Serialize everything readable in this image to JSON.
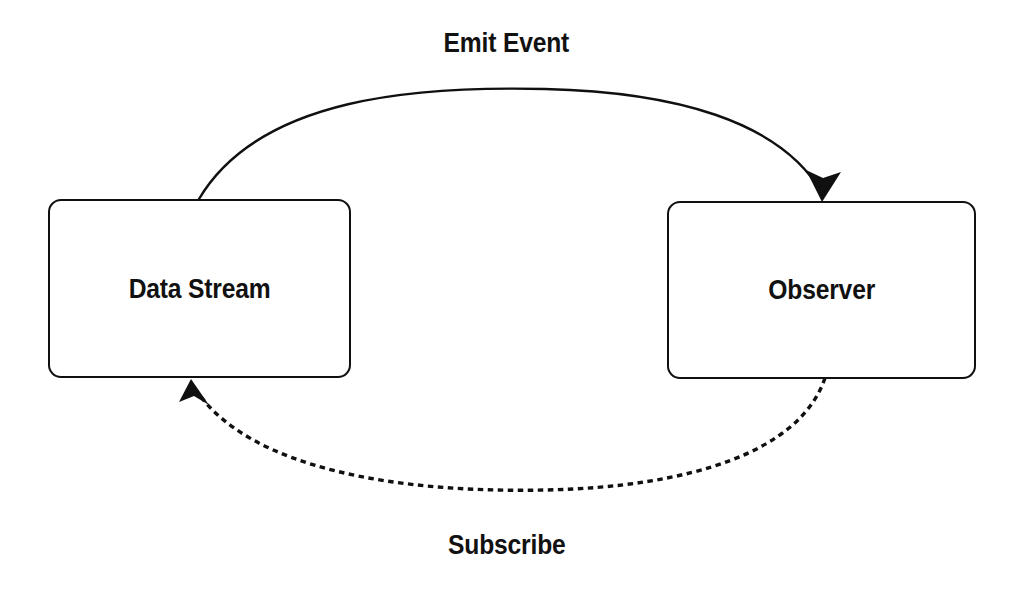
{
  "diagram": {
    "background_color": "#ffffff",
    "stroke_color": "#101010",
    "nodes": [
      {
        "id": "data-stream",
        "label": "Data Stream",
        "shape": "rounded-rectangle",
        "x": 48,
        "y": 199,
        "width": 303,
        "height": 179
      },
      {
        "id": "observer",
        "label": "Observer",
        "shape": "rounded-rectangle",
        "x": 667,
        "y": 201,
        "width": 309,
        "height": 178
      }
    ],
    "edges": [
      {
        "id": "emit-event",
        "label": "Emit Event",
        "from": "data-stream",
        "to": "observer",
        "style": "solid",
        "arrowhead": "filled-triangle",
        "direction": "left-to-right",
        "path": "M 199 199 C 260 96, 420 86, 545 89 C 672 92, 780 120, 822 193"
      },
      {
        "id": "subscribe",
        "label": "Subscribe",
        "from": "observer",
        "to": "data-stream",
        "style": "dashed",
        "arrowhead": "filled-triangle",
        "direction": "right-to-left",
        "path": "M 825 378 C 800 452, 690 487, 545 490 C 400 493, 250 470, 196 390"
      }
    ]
  }
}
